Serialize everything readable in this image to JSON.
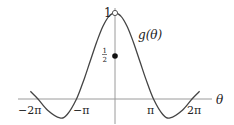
{
  "chart_data": {
    "type": "line",
    "title": "",
    "xlabel": "θ",
    "ylabel": "",
    "series": [
      {
        "name": "g(θ)",
        "x": [
          -6.9,
          -6.283,
          -5.5,
          -4.5,
          -3.9,
          -3.1416,
          -2.5,
          -2,
          -1.5,
          -1,
          -0.5,
          0,
          0.5,
          1,
          1.5,
          2,
          2.5,
          3.1416,
          3.9,
          4.5,
          5.5,
          6.283,
          6.9
        ],
        "values": [
          0.09,
          0.0,
          -0.13,
          -0.22,
          -0.18,
          0.0,
          0.24,
          0.45,
          0.66,
          0.84,
          0.96,
          1.0,
          0.96,
          0.84,
          0.66,
          0.45,
          0.24,
          0.0,
          -0.18,
          -0.22,
          -0.13,
          0.0,
          0.09
        ]
      }
    ],
    "special_points": [
      {
        "x": 0,
        "y": 1,
        "style": "open-circle",
        "label": "1"
      },
      {
        "x": 0,
        "y": 0.5,
        "style": "filled-dot",
        "label": "1/2"
      }
    ],
    "x_tick_labels": [
      "−2π",
      "−π",
      "π",
      "2π"
    ],
    "x_ticks": [
      -6.2832,
      -3.1416,
      3.1416,
      6.2832
    ],
    "y_tick_labels": [
      "1",
      "1/2"
    ],
    "curve_label": "g(θ)",
    "xlim": [
      -7.7,
      7.7
    ],
    "ylim": [
      -0.3,
      1.1
    ],
    "grid": false,
    "legend": "none"
  },
  "labels": {
    "theta": "θ",
    "curve": "g(θ)",
    "one": "1",
    "half_num": "1",
    "half_den": "2",
    "neg_two_pi": "−2π",
    "neg_pi": "−π",
    "pi": "π",
    "two_pi": "2π"
  },
  "colors": {
    "curve": "#444444",
    "axis": "#9a9a9a",
    "text": "#222222"
  }
}
